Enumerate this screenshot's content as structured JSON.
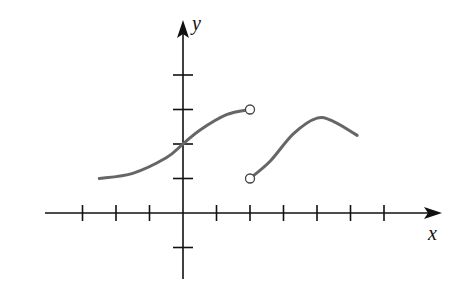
{
  "chart_data": {
    "type": "line",
    "title": "",
    "xlabel": "x",
    "ylabel": "y",
    "grid": false,
    "legend": null,
    "axis_ticks": {
      "x": [
        -3,
        -2,
        -1,
        1,
        2,
        3,
        4,
        5,
        6
      ],
      "y": [
        -1,
        1,
        2,
        3,
        4
      ]
    },
    "xlim": [
      -4,
      7.5
    ],
    "ylim": [
      -2,
      5
    ],
    "tick_labels_shown": false,
    "series": [
      {
        "name": "piece-1",
        "points": [
          [
            -2.5,
            1.0
          ],
          [
            -1.5,
            1.15
          ],
          [
            -0.5,
            1.6
          ],
          [
            0,
            2.0
          ],
          [
            0.5,
            2.4
          ],
          [
            1.3,
            2.85
          ],
          [
            2,
            3.0
          ]
        ],
        "left_endpoint": {
          "x": -2.5,
          "y": 1.0,
          "style": "none"
        },
        "right_endpoint": {
          "x": 2,
          "y": 3,
          "style": "open"
        }
      },
      {
        "name": "piece-2",
        "points": [
          [
            2,
            1.0
          ],
          [
            2.6,
            1.5
          ],
          [
            3.3,
            2.3
          ],
          [
            4,
            2.75
          ],
          [
            4.5,
            2.65
          ],
          [
            5.2,
            2.25
          ]
        ],
        "left_endpoint": {
          "x": 2,
          "y": 1,
          "style": "open"
        },
        "right_endpoint": {
          "x": 5.2,
          "y": 2.25,
          "style": "none"
        }
      }
    ],
    "annotations": [],
    "colors": {
      "curve": "#666666",
      "axis": "#111111"
    }
  },
  "labels": {
    "x": "x",
    "y": "y"
  }
}
